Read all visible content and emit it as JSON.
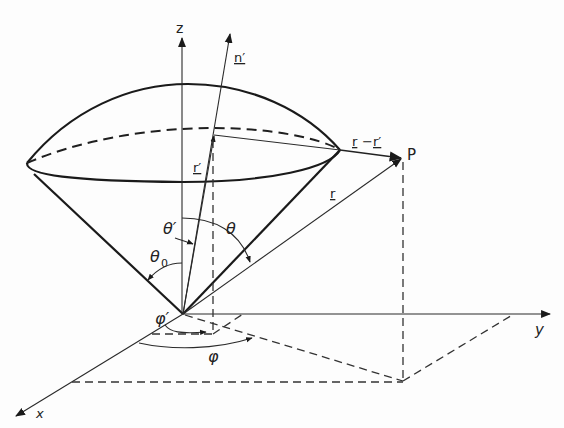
{
  "figure": {
    "labels": {
      "z_axis": "z",
      "y_axis": "y",
      "x_axis": "x",
      "n_prime": "n′",
      "r_prime": "r′",
      "r": "r",
      "r_minus_r_prime_a": "r",
      "r_minus_r_prime_sep": "−",
      "r_minus_r_prime_b": "r′",
      "point_P": "P",
      "theta_0": "θ",
      "theta_0_sub": "0",
      "theta_prime": "θ′",
      "theta": "θ",
      "phi_prime": "φ′",
      "phi": "φ"
    },
    "colors": {
      "ink": "#1a1a1a",
      "background": "#fdfdfd"
    }
  }
}
